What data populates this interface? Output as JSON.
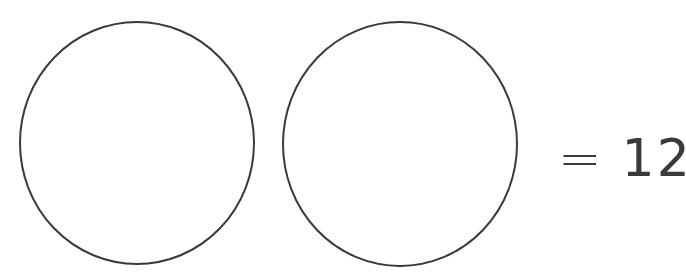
{
  "diagram": {
    "shapes": [
      {
        "type": "circle",
        "label": "circle-1",
        "cx": 137,
        "cy": 143,
        "rx": 117,
        "ry": 121
      },
      {
        "type": "circle",
        "label": "circle-2",
        "cx": 400,
        "cy": 144,
        "rx": 117,
        "ry": 122
      }
    ],
    "stroke_color": "#3a3a3a",
    "fill_color": "#ffffff",
    "equation": {
      "operator": "=",
      "value": "12"
    }
  }
}
